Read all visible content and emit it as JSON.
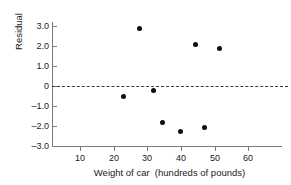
{
  "chart_data": {
    "type": "scatter",
    "title": "",
    "xlabel": "Weight of car  (hundreds of pounds)",
    "ylabel": "Residual",
    "xlim": [
      2,
      70
    ],
    "ylim": [
      -3.0,
      3.4
    ],
    "grid": false,
    "legend": null,
    "xticks": [
      10,
      20,
      30,
      40,
      50,
      60
    ],
    "xtick_labels": [
      "10",
      "20",
      "30",
      "40",
      "50",
      "60"
    ],
    "yticks": [
      3.0,
      2.0,
      1.0,
      0,
      -1.0,
      -2.0,
      -3.0
    ],
    "ytick_labels": [
      "3.0",
      "2.0",
      "1.0",
      "0",
      "–1.0",
      "–2.0",
      "–3.0"
    ],
    "reference_line": {
      "y": 0,
      "style": "dashed",
      "label": "zero-residual-line"
    },
    "marker": {
      "shape": "circle",
      "color": "#0d0d0d",
      "size": 5
    },
    "points": [
      {
        "x": 23.0,
        "y": -0.5
      },
      {
        "x": 27.7,
        "y": 2.9
      },
      {
        "x": 32.0,
        "y": -0.2
      },
      {
        "x": 34.5,
        "y": -1.8
      },
      {
        "x": 40.0,
        "y": -2.25
      },
      {
        "x": 44.5,
        "y": 2.1
      },
      {
        "x": 47.0,
        "y": -2.05
      },
      {
        "x": 51.5,
        "y": 1.9
      }
    ]
  }
}
